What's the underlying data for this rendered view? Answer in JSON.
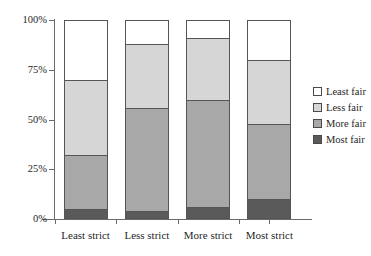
{
  "chart_data": {
    "type": "bar",
    "stacked": true,
    "title": "",
    "xlabel": "",
    "ylabel": "",
    "categories": [
      "Least strict",
      "Less strict",
      "More strict",
      "Most strict"
    ],
    "series": [
      {
        "name": "Most fair",
        "color": "#5a5a5a",
        "values": [
          5,
          4,
          6,
          10
        ]
      },
      {
        "name": "More fair",
        "color": "#a8a8a8",
        "values": [
          27,
          52,
          54,
          38
        ]
      },
      {
        "name": "Less fair",
        "color": "#d6d6d6",
        "values": [
          38,
          32,
          31,
          32
        ]
      },
      {
        "name": "Least fair",
        "color": "#ffffff",
        "values": [
          30,
          12,
          9,
          20
        ]
      }
    ],
    "ylim": [
      0,
      100
    ],
    "y_ticks": [
      "0%",
      "25%",
      "50%",
      "75%",
      "100%"
    ],
    "y_tick_values": [
      0,
      25,
      50,
      75,
      100
    ],
    "grid": false,
    "legend_position": "right",
    "legend_entries": [
      "Least fair",
      "Less fair",
      "More fair",
      "Most fair"
    ],
    "cumulative_tops": {
      "Least strict": {
        "Most fair": 5,
        "More fair": 32,
        "Less fair": 70,
        "Least fair": 100
      },
      "Less strict": {
        "Most fair": 4,
        "More fair": 56,
        "Less fair": 88,
        "Least fair": 100
      },
      "More strict": {
        "Most fair": 6,
        "More fair": 60,
        "Less fair": 91,
        "Least fair": 100
      },
      "Most strict": {
        "Most fair": 10,
        "More fair": 48,
        "Less fair": 80,
        "Least fair": 100
      }
    }
  },
  "colors": {
    "axis": "#6b6b6b",
    "outline": "#555555",
    "text": "#1f1f1f",
    "background": "#ffffff"
  }
}
